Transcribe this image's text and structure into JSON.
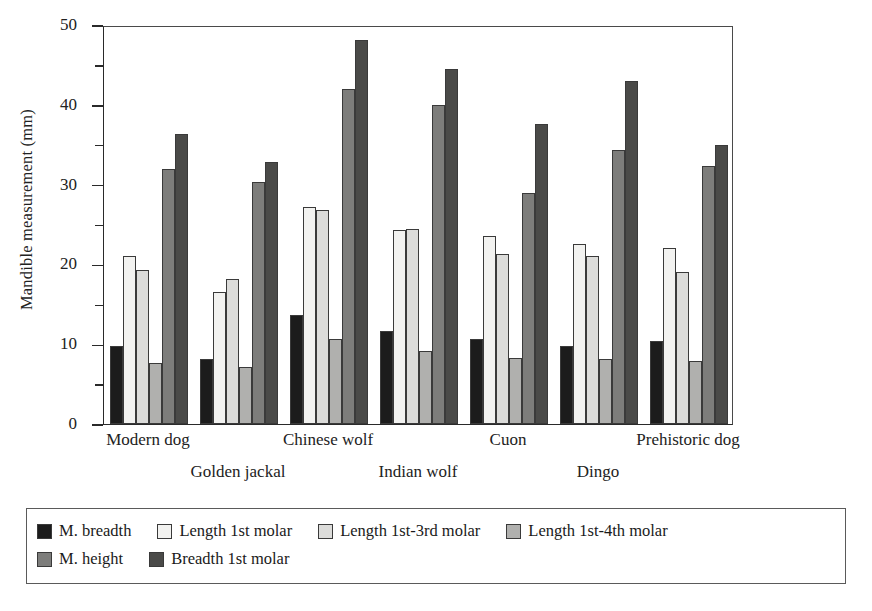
{
  "chart_data": {
    "type": "bar",
    "title": "",
    "subtitle": "",
    "xlabel": "",
    "ylabel": "Mandible measurement (mm)",
    "ylim": [
      0,
      50
    ],
    "ytick_step_major": 10,
    "ytick_step_minor": 5,
    "ytick_labels": [
      "0",
      "10",
      "20",
      "30",
      "40",
      "50"
    ],
    "grid": false,
    "legend_position": "bottom",
    "categories": [
      "Modern dog",
      "Golden jackal",
      "Chinese wolf",
      "Indian wolf",
      "Cuon",
      "Dingo",
      "Prehistoric dog"
    ],
    "series": [
      {
        "name": "M. breadth",
        "color": "#1c1c1c",
        "values": [
          9.8,
          8.2,
          13.6,
          11.6,
          10.7,
          9.8,
          10.4
        ]
      },
      {
        "name": "Length 1st molar",
        "color": "#f2f2f0",
        "values": [
          21.0,
          16.6,
          27.2,
          24.3,
          23.5,
          22.5,
          22.1
        ]
      },
      {
        "name": "Length 1st-3rd molar",
        "color": "#dcdcda",
        "values": [
          19.3,
          18.2,
          26.8,
          24.4,
          21.3,
          21.1,
          19.0
        ]
      },
      {
        "name": "Length 1st-4th molar",
        "color": "#b0b0ae",
        "values": [
          7.6,
          7.1,
          10.6,
          9.1,
          8.3,
          8.2,
          7.9
        ]
      },
      {
        "name": "M. height",
        "color": "#7d7d7b",
        "values": [
          31.9,
          30.3,
          42.0,
          40.0,
          28.9,
          34.4,
          32.3
        ]
      },
      {
        "name": "Breadth 1st molar",
        "color": "#4a4a48",
        "values": [
          36.3,
          32.8,
          48.1,
          44.5,
          37.6,
          43.0,
          35.0
        ]
      }
    ]
  },
  "legend": {
    "items": [
      {
        "label": "M. breadth"
      },
      {
        "label": "Length 1st molar"
      },
      {
        "label": "Length 1st-3rd molar"
      },
      {
        "label": "Length 1st-4th molar"
      },
      {
        "label": "M. height"
      },
      {
        "label": "Breadth 1st molar"
      }
    ]
  }
}
